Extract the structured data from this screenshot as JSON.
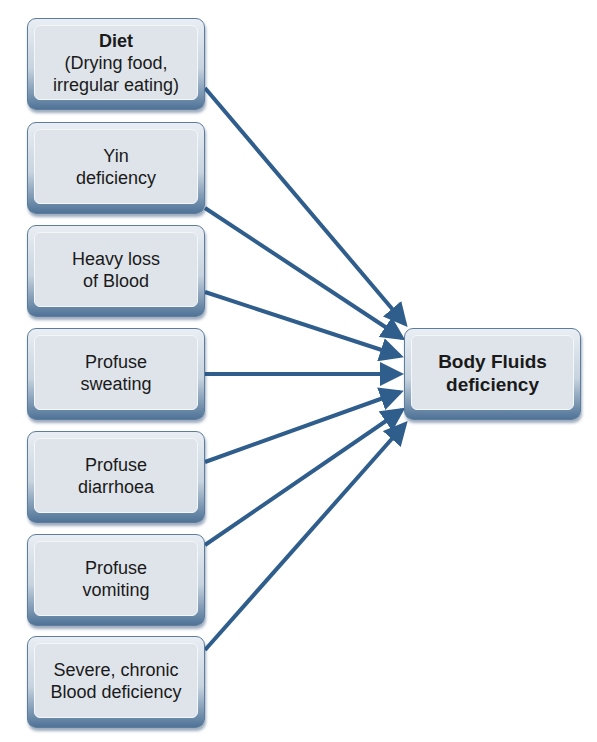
{
  "diagram": {
    "target": {
      "line1": "Body Fluids",
      "line2": "deficiency"
    },
    "causes": [
      {
        "title": "Diet",
        "line1": "(Drying food,",
        "line2": "irregular eating)"
      },
      {
        "line1": "Yin",
        "line2": "deficiency"
      },
      {
        "line1": "Heavy loss",
        "line2": "of Blood"
      },
      {
        "line1": "Profuse",
        "line2": "sweating"
      },
      {
        "line1": "Profuse",
        "line2": "diarrhoea"
      },
      {
        "line1": "Profuse",
        "line2": "vomiting"
      },
      {
        "line1": "Severe, chronic",
        "line2": "Blood deficiency"
      }
    ],
    "colors": {
      "arrow": "#2f5d8c",
      "box_fill": "#dfe4ea",
      "box_border": "#5e7d9c"
    }
  }
}
